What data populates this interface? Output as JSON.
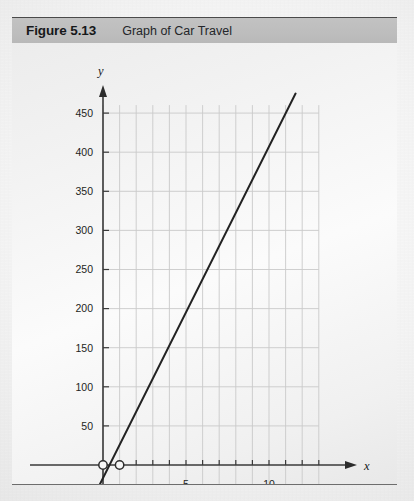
{
  "figure": {
    "number_label": "Figure 5.13",
    "title": "Graph of Car Travel"
  },
  "chart_data": {
    "type": "line",
    "title": "Graph of Car Travel",
    "xlabel": "x",
    "ylabel": "y",
    "xlim": [
      -0.6,
      13.0
    ],
    "ylim": [
      -35,
      500
    ],
    "grid": true,
    "legend": null,
    "x_tick_step": 1,
    "y_tick_step": 50,
    "x_tick_labels": [
      "5",
      "10"
    ],
    "x_tick_label_values": [
      5,
      10
    ],
    "y_tick_labels": [
      "50",
      "100",
      "150",
      "200",
      "250",
      "300",
      "350",
      "400",
      "450"
    ],
    "y_tick_label_values": [
      50,
      100,
      150,
      200,
      250,
      300,
      350,
      400,
      450
    ],
    "axis_label_x": "x",
    "axis_label_y": "y",
    "series": [
      {
        "name": "Car Travel",
        "type": "line",
        "x": [
          -0.55,
          11.6
        ],
        "values": [
          -40,
          475
        ],
        "slope": 42,
        "intercept": 0,
        "color": "#232323"
      }
    ],
    "markers": [
      {
        "name": "open-circle-origin",
        "x": 0,
        "y": 0,
        "style": "open"
      },
      {
        "name": "open-circle-one",
        "x": 1,
        "y": 0,
        "style": "open"
      }
    ]
  },
  "colors": {
    "grid": "#c9c9c9",
    "axis": "#3a3a3a",
    "line": "#232323",
    "header_band": "#bdbdbd",
    "card_bg": "#f4f4f4",
    "text": "#16181a"
  }
}
